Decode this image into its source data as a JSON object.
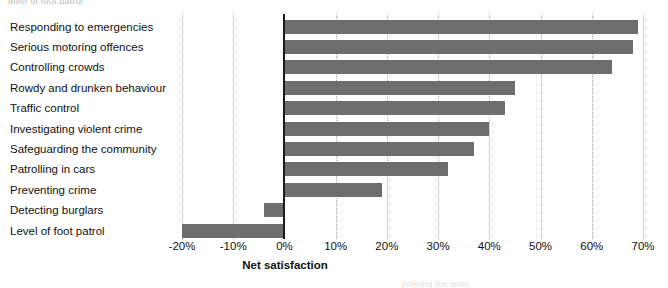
{
  "page": {
    "top_clipped_text": "level of foot patrol",
    "bottom_clipped_text": "policing the seas"
  },
  "chart_data": {
    "type": "bar",
    "orientation": "horizontal",
    "title": "",
    "xlabel": "Net satisfaction",
    "ylabel": "",
    "xlim": [
      -20,
      70
    ],
    "xtick_values": [
      -20,
      -10,
      0,
      10,
      20,
      30,
      40,
      50,
      60,
      70
    ],
    "xtick_labels": [
      "-20%",
      "-10%",
      "0%",
      "10%",
      "20%",
      "30%",
      "40%",
      "50%",
      "60%",
      "70%"
    ],
    "grid": true,
    "grid_style": "dotted-vertical",
    "legend": null,
    "bar_color": "#6e6e6e",
    "axis_color": "#1a1a1a",
    "categories": [
      "Responding to emergencies",
      "Serious motoring offences",
      "Controlling crowds",
      "Rowdy and drunken behaviour",
      "Traffic control",
      "Investigating violent crime",
      "Safeguarding the community",
      "Patrolling in cars",
      "Preventing crime",
      "Detecting burglars",
      "Level of foot patrol"
    ],
    "values": [
      69,
      68,
      64,
      45,
      43,
      40,
      37,
      32,
      19,
      -4,
      -20
    ],
    "value_labels": [
      "69%",
      "68%",
      "64%",
      "45%",
      "43%",
      "40%",
      "37%",
      "32%",
      "19%",
      "-4%",
      "-20%"
    ]
  }
}
